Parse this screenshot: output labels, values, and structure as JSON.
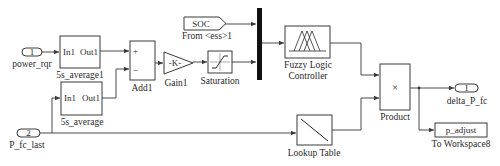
{
  "diagram": {
    "type": "simulink-block-diagram",
    "inports": [
      {
        "number": "1",
        "name": "power_rqr"
      },
      {
        "number": "2",
        "name": "P_fc_last"
      }
    ],
    "subsystems": [
      {
        "name": "5s_average1",
        "in": "In1",
        "out": "Out1"
      },
      {
        "name": "5s_average",
        "in": "In1",
        "out": "Out1"
      }
    ],
    "sum": {
      "name": "Add1",
      "signs": [
        "+",
        "−"
      ]
    },
    "gain": {
      "name": "Gain1",
      "value": "-K-"
    },
    "saturation": {
      "name": "Saturation"
    },
    "from": {
      "tag": "SOC",
      "name": "From <ess>1"
    },
    "mux": {
      "name": "Mux"
    },
    "fuzzy": {
      "name_line1": "Fuzzy Logic",
      "name_line2": "Controller"
    },
    "lookup": {
      "name": "Lookup Table"
    },
    "product": {
      "name": "Product",
      "symbol": "×"
    },
    "outport": {
      "number": "1",
      "name": "delta_P_fc"
    },
    "to_workspace": {
      "variable": "p_adjust",
      "name": "To Workspace8"
    }
  }
}
